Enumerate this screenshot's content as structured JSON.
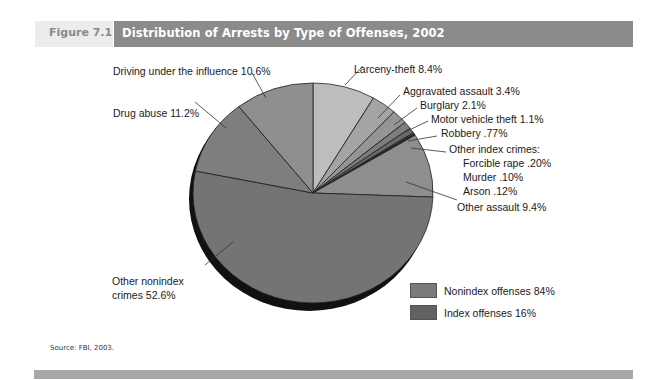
{
  "header": {
    "figure_label": "Figure 7.1",
    "title": "Distribution of Arrests by Type of Offenses, 2002"
  },
  "chart_data": {
    "type": "pie",
    "title": "Distribution of Arrests by Type of Offenses, 2002",
    "start_angle_deg": 0,
    "direction": "clockwise",
    "slices": [
      {
        "label": "Larceny-theft",
        "value": 8.4,
        "group": "Index offenses",
        "color": "#bdbdbd"
      },
      {
        "label": "Aggravated assault",
        "value": 3.4,
        "group": "Index offenses",
        "color": "#a4a4a4"
      },
      {
        "label": "Burglary",
        "value": 2.1,
        "group": "Index offenses",
        "color": "#959595"
      },
      {
        "label": "Motor vehicle theft",
        "value": 1.1,
        "group": "Index offenses",
        "color": "#7d7d7d"
      },
      {
        "label": "Robbery",
        "value": 0.77,
        "group": "Index offenses",
        "color": "#6a6a6a"
      },
      {
        "label": "Forcible rape",
        "value": 0.2,
        "group": "Index offenses",
        "color": "#5a5a5a"
      },
      {
        "label": "Murder",
        "value": 0.1,
        "group": "Index offenses",
        "color": "#4a4a4a"
      },
      {
        "label": "Arson",
        "value": 0.12,
        "group": "Index offenses",
        "color": "#3c3c3c"
      },
      {
        "label": "Other assault",
        "value": 9.4,
        "group": "Nonindex offenses",
        "color": "#8e8e8e"
      },
      {
        "label": "Other nonindex crimes",
        "value": 52.6,
        "group": "Nonindex offenses",
        "color": "#747474"
      },
      {
        "label": "Drug abuse",
        "value": 11.2,
        "group": "Nonindex offenses",
        "color": "#7e7e7e"
      },
      {
        "label": "Driving under the influence",
        "value": 10.6,
        "group": "Nonindex offenses",
        "color": "#8f8f8f"
      }
    ],
    "groups": [
      {
        "label": "Nonindex offenses",
        "value": 84,
        "color": "#7a7a7a"
      },
      {
        "label": "Index offenses",
        "value": 16,
        "color": "#626262"
      }
    ]
  },
  "labels": {
    "dui": "Driving under the influence 10.6%",
    "drug": "Drug abuse 11.2%",
    "larceny": "Larceny-theft 8.4%",
    "aggravated": "Aggravated assault 3.4%",
    "burglary": "Burglary 2.1%",
    "mvt": "Motor vehicle theft 1.1%",
    "robbery": "Robbery .77%",
    "other_index_header": "Other index crimes:",
    "rape": "Forcible rape .20%",
    "murder": "Murder .10%",
    "arson": "Arson .12%",
    "other_assault": "Other assault 9.4%",
    "nonindex_line1": "Other nonindex",
    "nonindex_line2": "crimes 52.6%"
  },
  "legend": {
    "items": [
      {
        "label": "Nonindex offenses 84%",
        "color": "#7a7a7a"
      },
      {
        "label": "Index offenses 16%",
        "color": "#626262"
      }
    ]
  },
  "footer": {
    "source": "Source: FBI, 2003."
  }
}
